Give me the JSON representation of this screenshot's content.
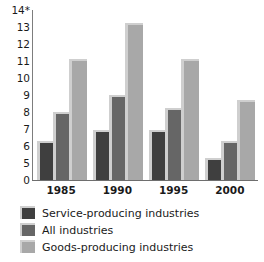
{
  "chart_data": {
    "type": "bar",
    "title": "",
    "subtitle": "",
    "xlabel": "",
    "ylabel": "",
    "categories": [
      "1985",
      "1990",
      "1995",
      "2000"
    ],
    "series": [
      {
        "name": "Service-producing industries",
        "color": "#3f3f3f",
        "values": [
          6.2,
          6.8,
          6.8,
          5.2
        ]
      },
      {
        "name": "All industries",
        "color": "#666666",
        "values": [
          7.9,
          8.9,
          8.1,
          6.2
        ]
      },
      {
        "name": "Goods-producing industries",
        "color": "#a8a8a8",
        "values": [
          11.0,
          13.1,
          11.0,
          8.6
        ]
      }
    ],
    "y_tick_labels": [
      "14*",
      "13",
      "12",
      "11",
      "10",
      "9",
      "8",
      "7",
      "6",
      "5",
      "0"
    ],
    "y_tick_values": [
      14,
      13,
      12,
      11,
      10,
      9,
      8,
      7,
      6,
      5,
      0
    ],
    "ylim": [
      0,
      14
    ],
    "axis_broken": true,
    "axis_break_note": "Axis is broken between 0 and 5; ticks are evenly spaced.",
    "grid": false,
    "legend_position": "bottom-left"
  },
  "legend": {
    "items": [
      {
        "label": "Service-producing industries",
        "color": "#3f3f3f"
      },
      {
        "label": "All industries",
        "color": "#666666"
      },
      {
        "label": "Goods-producing industries",
        "color": "#a8a8a8"
      }
    ]
  }
}
